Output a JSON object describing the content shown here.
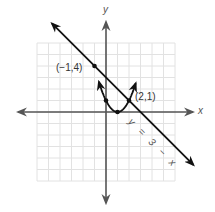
{
  "chart_data": {
    "type": "line",
    "title": "",
    "xlabel": "x",
    "ylabel": "y",
    "xlim": [
      -6,
      6
    ],
    "ylim": [
      -6,
      6
    ],
    "grid": true,
    "grid_step": 1,
    "series": [
      {
        "name": "parabola",
        "equation": "y = (x - 1)^2",
        "points": [
          [
            -1,
            4
          ],
          [
            0,
            1
          ],
          [
            1,
            0
          ],
          [
            2,
            1
          ]
        ]
      },
      {
        "name": "line",
        "label": "y = 3 − x",
        "equation": "y = 3 - x",
        "points": [
          [
            -1,
            4
          ],
          [
            2,
            1
          ],
          [
            3,
            0
          ]
        ]
      }
    ],
    "marked_points": [
      [
        -1,
        4
      ],
      [
        0,
        1
      ],
      [
        1,
        0
      ],
      [
        2,
        1
      ]
    ],
    "annotations": [
      {
        "text": "(−1,4)",
        "at": [
          -1,
          4
        ]
      },
      {
        "text": "(2,1)",
        "at": [
          2,
          1
        ]
      },
      {
        "text": "y = 3 − x",
        "along": "line"
      }
    ]
  },
  "labels": {
    "x_axis": "x",
    "y_axis": "y",
    "point_a": "(−1,4)",
    "point_b": "(2,1)",
    "line_eq": "y = 3 − x"
  },
  "colors": {
    "grid": "#e2e2e2",
    "axes": "#555555",
    "curves": "#111111"
  }
}
